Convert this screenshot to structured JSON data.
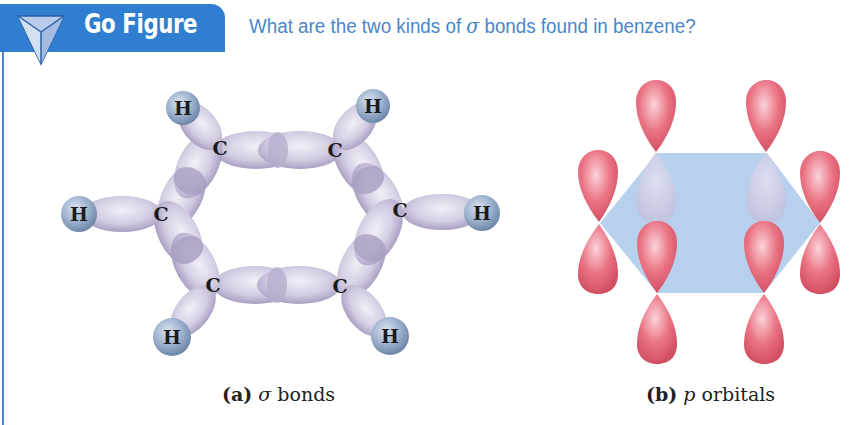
{
  "header": {
    "badge_label": "Go Figure",
    "badge_icon": "triangle-icon",
    "question_prefix": "What are the two kinds of ",
    "question_symbol": "σ",
    "question_suffix": " bonds found in benzene?"
  },
  "colors": {
    "header_blue": "#2f7ed0",
    "question_blue": "#4a86c8",
    "hydrogen": "#9fb4cf",
    "sigma_bond": "#d8d3e6",
    "p_orbital": "#ea6f80",
    "ring_plane": "#a9c8ea"
  },
  "figure_a": {
    "caption_letter": "(a)",
    "caption_symbol": "σ",
    "caption_text": " bonds",
    "atoms": {
      "carbon_label": "C",
      "hydrogen_label": "H"
    }
  },
  "figure_b": {
    "caption_letter": "(b)",
    "caption_symbol": "p",
    "caption_text": " orbitals"
  }
}
